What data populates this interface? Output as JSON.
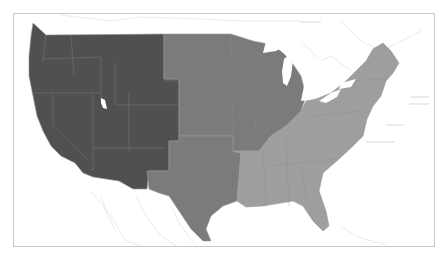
{
  "map": {
    "type": "choropleth",
    "subject": "United States regions",
    "regions": [
      {
        "id": "west",
        "name": "West",
        "color": "#505050"
      },
      {
        "id": "midwest",
        "name": "Midwest",
        "color": "#7b7b7b"
      },
      {
        "id": "south-central",
        "name": "South Central",
        "color": "#7b7b7b"
      },
      {
        "id": "east",
        "name": "East",
        "color": "#9e9e9e"
      }
    ],
    "basemap_color": "#ffffff",
    "border_color": "#c8c8c8"
  }
}
